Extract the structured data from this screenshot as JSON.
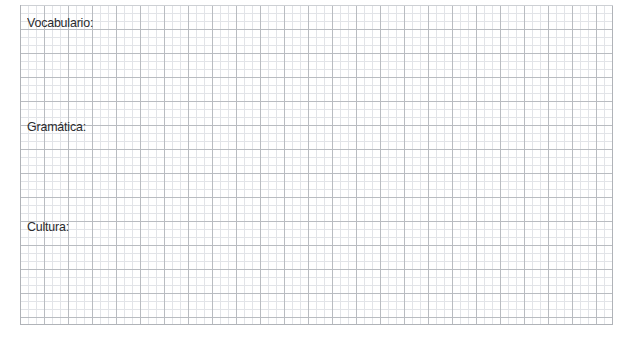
{
  "page": {
    "background_color": "#ffffff",
    "width": 638,
    "height": 347
  },
  "grid": {
    "name": "graph-paper",
    "minor_cell_px": 8,
    "major_cell_px": 24,
    "minor_line_color": "#e2e4e8",
    "major_line_color": "#b9bcc1",
    "border_color": "#b0b3b8",
    "left": 20,
    "top": 5,
    "width": 593,
    "height": 320
  },
  "worksheet": {
    "text_color": "#2b2b2e",
    "sections": [
      {
        "id": "vocabulario",
        "label": "Vocabulario:"
      },
      {
        "id": "gramatica",
        "label": "Gramática:"
      },
      {
        "id": "cultura",
        "label": "Cultura:"
      }
    ]
  }
}
